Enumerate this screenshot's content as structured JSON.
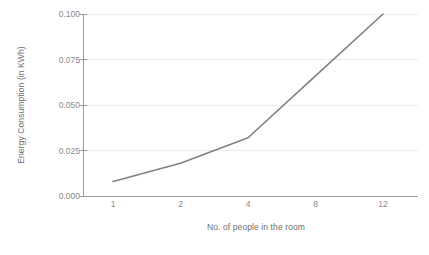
{
  "chart_data": {
    "type": "line",
    "title": "",
    "xlabel": "No. of people in the room",
    "ylabel": "Energy Consumption (in KWh)",
    "categories": [
      "1",
      "2",
      "4",
      "8",
      "12"
    ],
    "values": [
      0.008,
      0.018,
      0.032,
      0.066,
      0.1
    ],
    "series": [
      {
        "name": "Energy Consumption",
        "values": [
          0.008,
          0.018,
          0.032,
          0.066,
          0.1
        ]
      }
    ],
    "ylim": [
      0.0,
      0.1
    ],
    "yticks": [
      "0.000",
      "0.025",
      "0.050",
      "0.075",
      "0.100"
    ],
    "ytick_values": [
      0.0,
      0.025,
      0.05,
      0.075,
      0.1
    ],
    "grid": true,
    "grid_axis": "y",
    "legend": false,
    "legend_position": "none",
    "line_color": "#808080",
    "grid_color": "#ededed",
    "axis_color": "#9a9a9a",
    "text_color": "#8a8a8a",
    "background_color": "#ffffff",
    "markers": false
  }
}
